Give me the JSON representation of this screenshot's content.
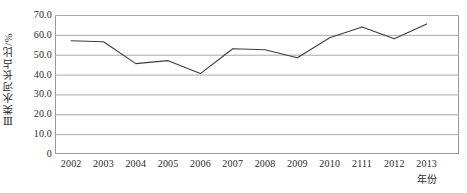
{
  "chart_data": {
    "type": "line",
    "title": "",
    "xlabel": "年份",
    "ylabel": "Ⅲ类水河长占比/%",
    "categories": [
      "2002",
      "2003",
      "2004",
      "2005",
      "2006",
      "2007",
      "2008",
      "2009",
      "2010",
      "2111",
      "2012",
      "2013"
    ],
    "values": [
      57.0,
      56.5,
      45.5,
      47.0,
      40.5,
      53.0,
      52.5,
      48.5,
      58.5,
      64.0,
      58.0,
      65.5
    ],
    "series": [
      {
        "name": "Ⅲ类水河长占比",
        "values": [
          57.0,
          56.5,
          45.5,
          47.0,
          40.5,
          53.0,
          52.5,
          48.5,
          58.5,
          64.0,
          58.0,
          65.5
        ]
      }
    ],
    "ylim": [
      0,
      70
    ],
    "ytick_labels": [
      "70.0",
      "60.0",
      "50.0",
      "40.0",
      "30.0",
      "20.0",
      "10.0",
      "0"
    ],
    "ytick_values": [
      70,
      60,
      50,
      40,
      30,
      20,
      10,
      0
    ],
    "xlim_categories": 12,
    "grid": "horizontal",
    "legend": "none",
    "line_color": "#3c3c3c",
    "grid_color": "#a8a8a8",
    "frame_color": "#9a9a9a",
    "marker": "none"
  },
  "axis": {
    "y_title": "Ⅲ类水河长占比/%",
    "x_title": "年份"
  }
}
